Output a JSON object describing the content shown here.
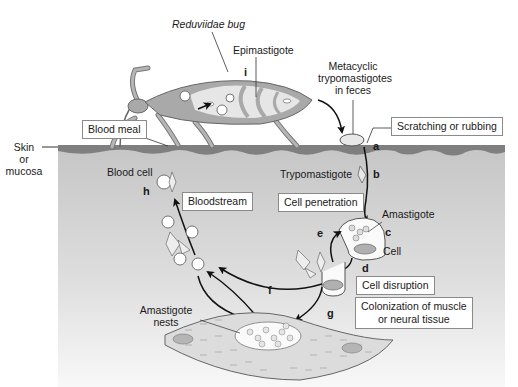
{
  "colors": {
    "skin_surface": "#7f7f7f",
    "tissue_top": "#c6c6c6",
    "tissue_bottom": "#f7f7f7",
    "bug_body": "#a9a9a9",
    "bug_inner": "#e6e6e6",
    "muscle": "#dcdcdc",
    "arrow": "#111111",
    "box_border": "#8a8a8a"
  },
  "labels": {
    "bug": "Reduviidae bug",
    "epimastigote": "Epimastigote",
    "metacyclic_line1": "Metacyclic",
    "metacyclic_line2": "trypomastigotes",
    "metacyclic_line3": "in feces",
    "skin_line1": "Skin",
    "skin_line2": "or",
    "skin_line3": "mucosa",
    "blood_cell": "Blood cell",
    "trypomastigote": "Trypomastigote",
    "amastigote": "Amastigote",
    "cell": "Cell",
    "amastigote_nests_line1": "Amastigote",
    "amastigote_nests_line2": "nests"
  },
  "boxes": {
    "blood_meal": "Blood meal",
    "scratching": "Scratching or rubbing",
    "bloodstream": "Bloodstream",
    "cell_penetration": "Cell penetration",
    "cell_disruption": "Cell disruption",
    "colonization_line1": "Colonization of muscle",
    "colonization_line2": "or neural tissue"
  },
  "steps": {
    "a": "a",
    "b": "b",
    "c": "c",
    "d": "d",
    "e": "e",
    "f": "f",
    "g": "g",
    "h": "h",
    "i": "i"
  }
}
